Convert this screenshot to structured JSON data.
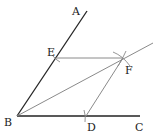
{
  "diagram": {
    "type": "geometry-construction",
    "points": {
      "A": {
        "label": "A",
        "x": 87,
        "y": 11
      },
      "B": {
        "label": "B",
        "x": 17,
        "y": 116
      },
      "C": {
        "label": "C",
        "x": 140,
        "y": 116
      },
      "D": {
        "label": "D",
        "x": 86,
        "y": 116
      },
      "E": {
        "label": "E",
        "x": 56,
        "y": 58
      },
      "F": {
        "label": "F",
        "x": 123,
        "y": 58
      }
    },
    "segments": [
      {
        "from": "B",
        "to": "A",
        "style": "dark"
      },
      {
        "from": "B",
        "to": "C",
        "style": "dark"
      },
      {
        "from": "E",
        "to": "F",
        "style": "gray"
      },
      {
        "from": "D",
        "to": "F",
        "style": "gray"
      },
      {
        "from": "B",
        "to": "F",
        "style": "gray",
        "extended": true
      }
    ],
    "colors": {
      "dark": "#222222",
      "gray": "#8a8a8a"
    }
  }
}
